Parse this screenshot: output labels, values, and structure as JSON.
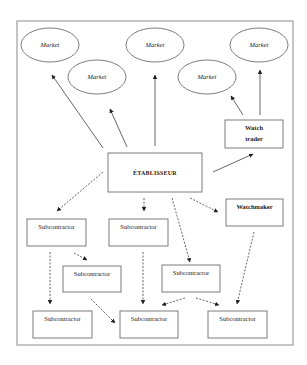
{
  "diagram": {
    "frame": {
      "x": 17,
      "y": 21,
      "w": 276,
      "h": 324
    },
    "nodes": [
      {
        "id": "market-1",
        "shape": "ellipse",
        "label": "Market",
        "cx": 50,
        "cy": 45,
        "rx": 29,
        "ry": 17,
        "style": "italic"
      },
      {
        "id": "market-2",
        "shape": "ellipse",
        "label": "Market",
        "cx": 97,
        "cy": 77,
        "rx": 29,
        "ry": 17,
        "style": "italic"
      },
      {
        "id": "market-3",
        "shape": "ellipse",
        "label": "Market",
        "cx": 155,
        "cy": 45,
        "rx": 29,
        "ry": 17,
        "style": "italic"
      },
      {
        "id": "market-4",
        "shape": "ellipse",
        "label": "Market",
        "cx": 207,
        "cy": 77,
        "rx": 29,
        "ry": 17,
        "style": "italic"
      },
      {
        "id": "market-5",
        "shape": "ellipse",
        "label": "Market",
        "cx": 259,
        "cy": 45,
        "rx": 29,
        "ry": 17,
        "style": "italic"
      },
      {
        "id": "watch-trader",
        "shape": "rect",
        "label": [
          "Watch",
          "trader"
        ],
        "x": 225,
        "y": 120,
        "w": 58,
        "h": 28,
        "style": "bold"
      },
      {
        "id": "etablisseur",
        "shape": "rect",
        "label": "ÉTABLISSEUR",
        "x": 108,
        "y": 153,
        "w": 94,
        "h": 39,
        "style": "main"
      },
      {
        "id": "watchmaker",
        "shape": "rect",
        "label": "Watchmaker",
        "x": 226,
        "y": 199,
        "w": 57,
        "h": 27,
        "style": "bold"
      },
      {
        "id": "subcontractor-a",
        "shape": "rect",
        "label": "Subcontractor",
        "x": 27,
        "y": 219,
        "w": 59,
        "h": 27,
        "style": "plain"
      },
      {
        "id": "subcontractor-b",
        "shape": "rect",
        "label": "Subcontractor",
        "x": 109,
        "y": 219,
        "w": 59,
        "h": 27,
        "style": "plain"
      },
      {
        "id": "subcontractor-c",
        "shape": "rect",
        "label": "Subcontractor",
        "x": 63,
        "y": 266,
        "w": 58,
        "h": 26,
        "style": "plain"
      },
      {
        "id": "subcontractor-d",
        "shape": "rect",
        "label": "Subcontractor",
        "x": 162,
        "y": 265,
        "w": 58,
        "h": 27,
        "style": "plain"
      },
      {
        "id": "subcontractor-e",
        "shape": "rect",
        "label": "Subcontractor",
        "x": 33,
        "y": 311,
        "w": 59,
        "h": 27,
        "style": "plain"
      },
      {
        "id": "subcontractor-f",
        "shape": "rect",
        "label": "Subcontractor",
        "x": 120,
        "y": 311,
        "w": 58,
        "h": 27,
        "style": "plain"
      },
      {
        "id": "subcontractor-g",
        "shape": "rect",
        "label": "Subcontractor",
        "x": 208,
        "y": 311,
        "w": 59,
        "h": 27,
        "style": "plain"
      }
    ],
    "edges": [
      {
        "from": "etablisseur",
        "to": "market-1",
        "type": "solid",
        "x1": 103,
        "y1": 148,
        "x2": 52,
        "y2": 75
      },
      {
        "from": "etablisseur",
        "to": "market-2",
        "type": "solid",
        "x1": 127,
        "y1": 147,
        "x2": 110,
        "y2": 109
      },
      {
        "from": "etablisseur",
        "to": "market-3",
        "type": "solid",
        "x1": 155,
        "y1": 146,
        "x2": 155,
        "y2": 75
      },
      {
        "from": "watch-trader",
        "to": "market-4",
        "type": "solid",
        "x1": 243,
        "y1": 115,
        "x2": 231,
        "y2": 96
      },
      {
        "from": "watch-trader",
        "to": "market-5",
        "type": "solid",
        "x1": 260,
        "y1": 115,
        "x2": 260,
        "y2": 70
      },
      {
        "from": "etablisseur",
        "to": "watch-trader",
        "type": "solid",
        "x1": 213,
        "y1": 172,
        "x2": 253,
        "y2": 154
      },
      {
        "from": "etablisseur",
        "to": "subcontractor-a",
        "type": "dashed",
        "x1": 103,
        "y1": 172,
        "x2": 57,
        "y2": 211
      },
      {
        "from": "etablisseur",
        "to": "subcontractor-b",
        "type": "dashed",
        "x1": 144,
        "y1": 198,
        "x2": 144,
        "y2": 211
      },
      {
        "from": "etablisseur",
        "to": "subcontractor-d",
        "type": "dashed",
        "x1": 172,
        "y1": 198,
        "x2": 190,
        "y2": 262
      },
      {
        "from": "etablisseur",
        "to": "watchmaker",
        "type": "dashed",
        "x1": 190,
        "y1": 198,
        "x2": 218,
        "y2": 212
      },
      {
        "from": "subcontractor-a",
        "to": "subcontractor-e",
        "type": "dashed",
        "x1": 50,
        "y1": 252,
        "x2": 50,
        "y2": 304
      },
      {
        "from": "subcontractor-a",
        "to": "subcontractor-c",
        "type": "dashed",
        "x1": 74,
        "y1": 253,
        "x2": 87,
        "y2": 260
      },
      {
        "from": "subcontractor-b",
        "to": "subcontractor-f",
        "type": "dashed",
        "x1": 143,
        "y1": 252,
        "x2": 143,
        "y2": 304
      },
      {
        "from": "subcontractor-c",
        "to": "subcontractor-f",
        "type": "dashed",
        "x1": 91,
        "y1": 299,
        "x2": 115,
        "y2": 323
      },
      {
        "from": "subcontractor-d",
        "to": "subcontractor-f",
        "type": "dashed",
        "x1": 185,
        "y1": 298,
        "x2": 162,
        "y2": 305
      },
      {
        "from": "subcontractor-d",
        "to": "subcontractor-g",
        "type": "dashed",
        "x1": 196,
        "y1": 298,
        "x2": 219,
        "y2": 305
      },
      {
        "from": "watchmaker",
        "to": "subcontractor-g",
        "type": "dashed",
        "x1": 254,
        "y1": 232,
        "x2": 237,
        "y2": 304
      }
    ]
  }
}
